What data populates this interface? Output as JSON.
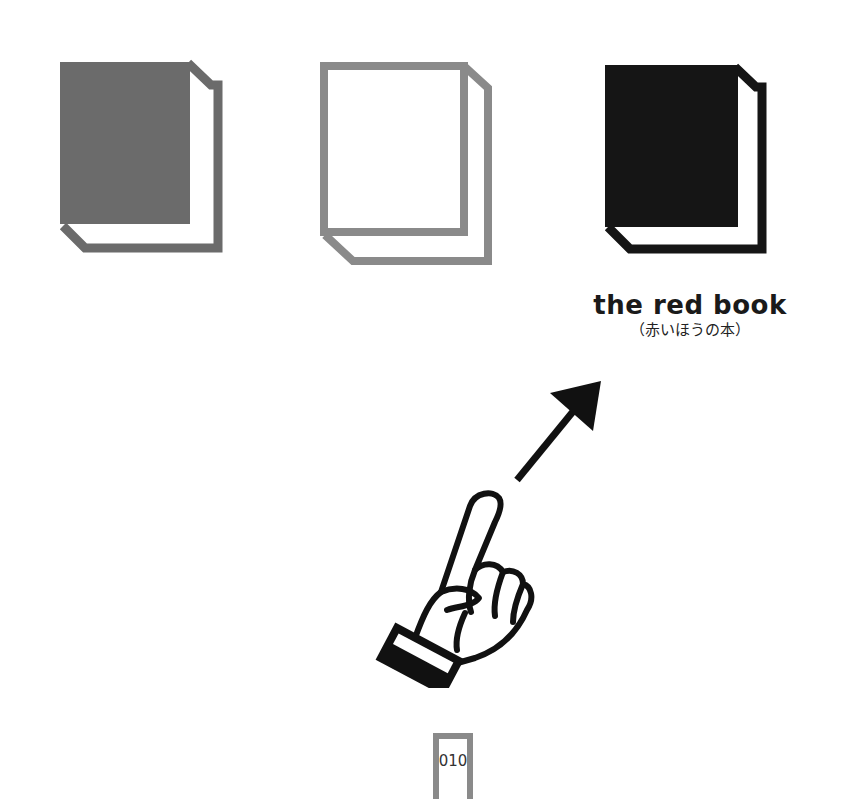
{
  "books": [
    {
      "id": "book-gray",
      "style": "filled",
      "color": "#6b6b6b"
    },
    {
      "id": "book-white",
      "style": "outline",
      "color": "#8a8a8a"
    },
    {
      "id": "book-black",
      "style": "filled",
      "color": "#151515"
    }
  ],
  "caption": {
    "title": "the red book",
    "subtitle": "（赤いほうの本）"
  },
  "pointer": {
    "icon": "pointing-hand-icon",
    "arrow": "arrow-up-right-icon",
    "target": "book-black"
  },
  "page": {
    "number": "010"
  },
  "colors": {
    "gray_book": "#6b6b6b",
    "outline_book": "#8a8a8a",
    "black_book": "#151515",
    "page_box": "#8a8a8a"
  }
}
